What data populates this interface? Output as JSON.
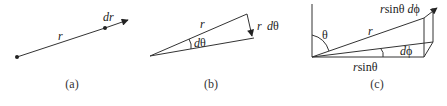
{
  "figure": {
    "panels": [
      {
        "id": "a",
        "caption": "(a)",
        "labels": {
          "r": "r",
          "dr": "dr"
        }
      },
      {
        "id": "b",
        "caption": "(b)",
        "labels": {
          "r": "r",
          "dtheta": "dθ",
          "r_dtheta_r": "r",
          "r_dtheta_d": "dθ"
        }
      },
      {
        "id": "c",
        "caption": "(c)",
        "labels": {
          "theta": "θ",
          "r": "r",
          "dphi": "dϕ",
          "rsintheta": "r",
          "rsintheta_sin": "sinθ",
          "arc_r": "r",
          "arc_rest": "sinθ dϕ"
        }
      }
    ]
  }
}
